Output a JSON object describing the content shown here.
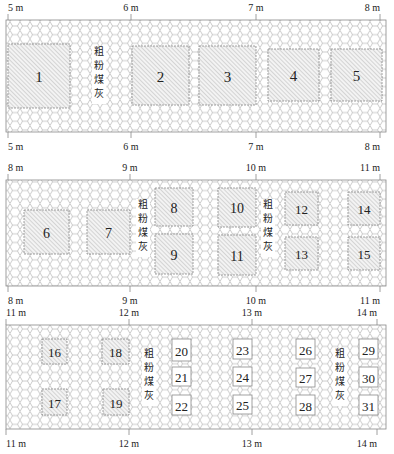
{
  "colors": {
    "hex_stroke": "#9a9a9a",
    "band_border": "#888888",
    "hatch": "#9a9a9a",
    "block_fill": "#f2f2f2",
    "text": "#222222"
  },
  "legend_label": "粗粉煤灰",
  "bands": [
    {
      "y": 20,
      "h": 112,
      "top_ticks": [
        {
          "x": 8,
          "label": "5 m"
        },
        {
          "x": 131,
          "label": "6 m"
        },
        {
          "x": 256,
          "label": "7 m"
        },
        {
          "x": 380,
          "label": "8 m"
        }
      ],
      "bottom_ticks": [
        {
          "x": 8,
          "label": "5 m"
        },
        {
          "x": 131,
          "label": "6 m"
        },
        {
          "x": 256,
          "label": "7 m"
        },
        {
          "x": 380,
          "label": "8 m"
        }
      ],
      "ash_labels": [
        {
          "x": 99,
          "y": 55
        }
      ],
      "blocks": [
        {
          "id": "1",
          "x": 8,
          "y": 44,
          "w": 62,
          "h": 64,
          "hatch": true,
          "fs": 15
        },
        {
          "id": "2",
          "x": 132,
          "y": 46,
          "w": 57,
          "h": 59,
          "hatch": true,
          "fs": 15
        },
        {
          "id": "3",
          "x": 199,
          "y": 46,
          "w": 57,
          "h": 59,
          "hatch": true,
          "fs": 15
        },
        {
          "id": "4",
          "x": 268,
          "y": 49,
          "w": 51,
          "h": 52,
          "hatch": true,
          "fs": 15
        },
        {
          "id": "5",
          "x": 331,
          "y": 49,
          "w": 51,
          "h": 52,
          "hatch": true,
          "fs": 15
        }
      ]
    },
    {
      "y": 180,
      "h": 106,
      "top_ticks": [
        {
          "x": 8,
          "label": "8 m"
        },
        {
          "x": 130,
          "label": "9 m"
        },
        {
          "x": 256,
          "label": "10 m"
        },
        {
          "x": 380,
          "label": "11 m"
        }
      ],
      "bottom_ticks": [
        {
          "x": 8,
          "label": "8 m"
        },
        {
          "x": 130,
          "label": "9 m"
        },
        {
          "x": 256,
          "label": "10 m"
        },
        {
          "x": 380,
          "label": "11 m"
        }
      ],
      "ash_labels": [
        {
          "x": 143,
          "y": 208
        },
        {
          "x": 268,
          "y": 208
        }
      ],
      "blocks": [
        {
          "id": "6",
          "x": 24,
          "y": 210,
          "w": 45,
          "h": 44,
          "hatch": true,
          "fs": 14
        },
        {
          "id": "7",
          "x": 87,
          "y": 210,
          "w": 43,
          "h": 44,
          "hatch": true,
          "fs": 14
        },
        {
          "id": "8",
          "x": 155,
          "y": 188,
          "w": 38,
          "h": 38,
          "hatch": true,
          "fs": 14
        },
        {
          "id": "9",
          "x": 155,
          "y": 234,
          "w": 38,
          "h": 40,
          "hatch": true,
          "fs": 14
        },
        {
          "id": "10",
          "x": 218,
          "y": 188,
          "w": 38,
          "h": 39,
          "hatch": true,
          "fs": 14
        },
        {
          "id": "11",
          "x": 218,
          "y": 235,
          "w": 38,
          "h": 40,
          "hatch": true,
          "fs": 14
        },
        {
          "id": "12",
          "x": 285,
          "y": 192,
          "w": 33,
          "h": 33,
          "hatch": true,
          "fs": 13
        },
        {
          "id": "13",
          "x": 285,
          "y": 237,
          "w": 33,
          "h": 33,
          "hatch": true,
          "fs": 13
        },
        {
          "id": "14",
          "x": 348,
          "y": 192,
          "w": 32,
          "h": 33,
          "hatch": true,
          "fs": 13
        },
        {
          "id": "15",
          "x": 348,
          "y": 237,
          "w": 32,
          "h": 33,
          "hatch": true,
          "fs": 13
        }
      ]
    },
    {
      "y": 325,
      "h": 104,
      "top_ticks": [
        {
          "x": 6,
          "label": "11 m"
        },
        {
          "x": 129,
          "label": "12 m"
        },
        {
          "x": 252,
          "label": "13 m"
        },
        {
          "x": 377,
          "label": "14 m"
        }
      ],
      "bottom_ticks": [
        {
          "x": 6,
          "label": "11 m"
        },
        {
          "x": 129,
          "label": "12 m"
        },
        {
          "x": 252,
          "label": "13 m"
        },
        {
          "x": 377,
          "label": "14 m"
        }
      ],
      "ash_labels": [
        {
          "x": 149,
          "y": 357
        },
        {
          "x": 340,
          "y": 357
        }
      ],
      "blocks": [
        {
          "id": "16",
          "x": 42,
          "y": 339,
          "w": 25,
          "h": 25,
          "hatch": true,
          "fs": 13
        },
        {
          "id": "17",
          "x": 42,
          "y": 389,
          "w": 25,
          "h": 26,
          "hatch": true,
          "fs": 13
        },
        {
          "id": "18",
          "x": 102,
          "y": 339,
          "w": 27,
          "h": 25,
          "hatch": true,
          "fs": 13
        },
        {
          "id": "19",
          "x": 103,
          "y": 389,
          "w": 26,
          "h": 26,
          "hatch": true,
          "fs": 13
        },
        {
          "id": "20",
          "x": 172,
          "y": 339,
          "w": 19,
          "h": 22,
          "hatch": false,
          "fs": 13
        },
        {
          "id": "21",
          "x": 172,
          "y": 367,
          "w": 19,
          "h": 19,
          "hatch": false,
          "fs": 13
        },
        {
          "id": "22",
          "x": 172,
          "y": 395,
          "w": 19,
          "h": 20,
          "hatch": false,
          "fs": 13
        },
        {
          "id": "23",
          "x": 233,
          "y": 339,
          "w": 19,
          "h": 20,
          "hatch": false,
          "fs": 13
        },
        {
          "id": "24",
          "x": 233,
          "y": 367,
          "w": 19,
          "h": 19,
          "hatch": false,
          "fs": 13
        },
        {
          "id": "25",
          "x": 233,
          "y": 395,
          "w": 19,
          "h": 19,
          "hatch": false,
          "fs": 13
        },
        {
          "id": "26",
          "x": 296,
          "y": 339,
          "w": 19,
          "h": 20,
          "hatch": false,
          "fs": 13
        },
        {
          "id": "27",
          "x": 296,
          "y": 368,
          "w": 19,
          "h": 19,
          "hatch": false,
          "fs": 13
        },
        {
          "id": "28",
          "x": 296,
          "y": 395,
          "w": 19,
          "h": 20,
          "hatch": false,
          "fs": 13
        },
        {
          "id": "29",
          "x": 359,
          "y": 339,
          "w": 19,
          "h": 20,
          "hatch": false,
          "fs": 13
        },
        {
          "id": "30",
          "x": 359,
          "y": 367,
          "w": 19,
          "h": 20,
          "hatch": false,
          "fs": 13
        },
        {
          "id": "31",
          "x": 359,
          "y": 395,
          "w": 19,
          "h": 20,
          "hatch": false,
          "fs": 13
        }
      ]
    }
  ]
}
